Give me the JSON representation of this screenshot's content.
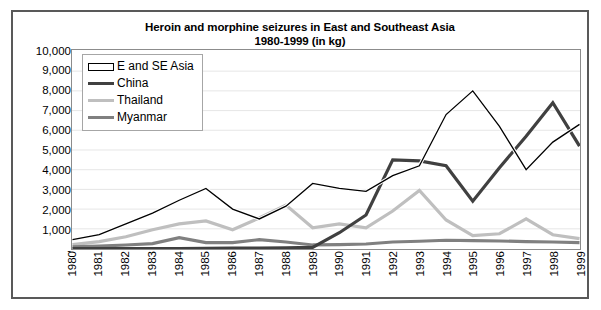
{
  "chart_data": {
    "type": "line",
    "title": "Heroin and morphine seizures in East and Southeast Asia 1980-1999 (in kg)",
    "title_line1": "Heroin and morphine seizures in East and Southeast Asia",
    "title_line2": "1980-1999 (in kg)",
    "xlabel": "",
    "ylabel": "",
    "x": [
      1980,
      1981,
      1982,
      1983,
      1984,
      1985,
      1986,
      1987,
      1988,
      1989,
      1990,
      1991,
      1992,
      1993,
      1994,
      1995,
      1996,
      1997,
      1998,
      1999
    ],
    "categories": [
      "1980",
      "1981",
      "1982",
      "1983",
      "1984",
      "1985",
      "1986",
      "1987",
      "1988",
      "1989",
      "1990",
      "1991",
      "1992",
      "1993",
      "1994",
      "1995",
      "1996",
      "1997",
      "1998",
      "1999"
    ],
    "ylim": [
      0,
      10000
    ],
    "ytick_values": [
      10000,
      9000,
      8000,
      7000,
      6000,
      5000,
      4000,
      3000,
      2000,
      1000,
      0
    ],
    "ytick_labels": [
      "10,000",
      "9,000",
      "8,000",
      "7,000",
      "6,000",
      "5,000",
      "4,000",
      "3,000",
      "2,000",
      "1,000",
      "-"
    ],
    "grid": true,
    "legend_position": "top-left",
    "series": [
      {
        "name": "E and SE Asia",
        "color": "#000000",
        "style": "outline",
        "width": 1.3,
        "values": [
          450,
          700,
          1250,
          1800,
          2450,
          3050,
          2000,
          1500,
          2150,
          3300,
          3050,
          2900,
          3700,
          4200,
          6800,
          8000,
          6200,
          4000,
          5400,
          6300
        ]
      },
      {
        "name": "China",
        "color": "#404040",
        "style": "solid",
        "width": 3.2,
        "values": [
          0,
          0,
          0,
          0,
          0,
          10,
          20,
          20,
          30,
          60,
          800,
          1700,
          4500,
          4450,
          4200,
          2400,
          4100,
          5700,
          7400,
          5200
        ]
      },
      {
        "name": "Thailand",
        "color": "#bfbfbf",
        "style": "solid",
        "width": 3.2,
        "values": [
          200,
          350,
          600,
          950,
          1250,
          1400,
          950,
          1550,
          2200,
          1050,
          1250,
          1050,
          1900,
          2950,
          1450,
          650,
          750,
          1500,
          700,
          500
        ]
      },
      {
        "name": "Myanmar",
        "color": "#808080",
        "style": "solid",
        "width": 3.2,
        "values": [
          80,
          120,
          180,
          250,
          550,
          300,
          300,
          450,
          330,
          180,
          200,
          230,
          330,
          370,
          420,
          400,
          380,
          350,
          330,
          300
        ]
      }
    ]
  },
  "legend": {
    "items": [
      {
        "label": "E and SE Asia",
        "swatch": "outline",
        "color": "#000000"
      },
      {
        "label": "China",
        "swatch": "line",
        "color": "#404040"
      },
      {
        "label": "Thailand",
        "swatch": "line",
        "color": "#bfbfbf"
      },
      {
        "label": "Myanmar",
        "swatch": "line",
        "color": "#808080"
      }
    ]
  }
}
